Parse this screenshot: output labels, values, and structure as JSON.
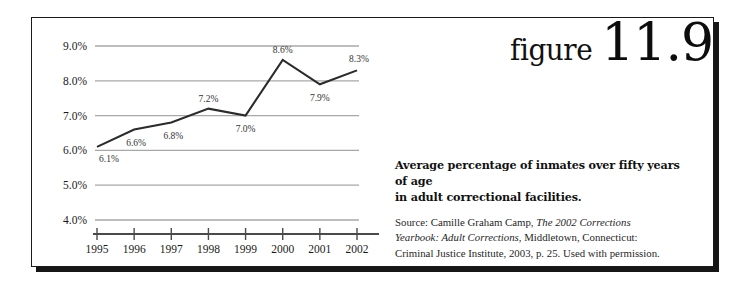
{
  "figure": {
    "word": "figure",
    "number": "11.9"
  },
  "caption": {
    "title_line1": "Average percentage of inmates over fifty years of age",
    "title_line2": "in adult correctional facilities.",
    "source_prefix": "Source: Camille Graham Camp, ",
    "source_italic1": "The 2002 Corrections",
    "source_italic2": "Yearbook: Adult Corrections",
    "source_mid": ", Middletown, Connecticut:",
    "source_tail": "Criminal Justice Institute, 2003, p. 25. Used with permission."
  },
  "chart_data": {
    "type": "line",
    "title": "Average percentage of inmates over fifty years of age in adult correctional facilities.",
    "xlabel": "",
    "ylabel": "",
    "categories": [
      "1995",
      "1996",
      "1997",
      "1998",
      "1999",
      "2000",
      "2001",
      "2002"
    ],
    "values": [
      6.1,
      6.6,
      6.8,
      7.2,
      7.0,
      8.6,
      7.9,
      8.3
    ],
    "point_labels": [
      "6.1%",
      "6.6%",
      "6.8%",
      "7.2%",
      "7.0%",
      "8.6%",
      "7.9%",
      "8.3%"
    ],
    "ylim": [
      4.0,
      9.0
    ],
    "ytick_values": [
      9.0,
      8.0,
      7.0,
      6.0,
      5.0,
      4.0
    ],
    "ytick_labels": [
      "9.0%",
      "8.0%",
      "7.0%",
      "6.0%",
      "5.0%",
      "4.0%"
    ],
    "grid": true,
    "legend": "none",
    "line_color": "#2b2b2b",
    "grid_color": "#a8a8a8",
    "axis_color": "#4a4a4a"
  }
}
